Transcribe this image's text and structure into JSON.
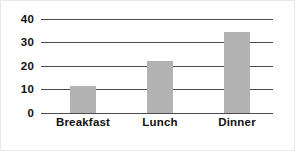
{
  "chart_data": {
    "type": "bar",
    "title": "",
    "xlabel": "",
    "ylabel": "",
    "categories": [
      "Breakfast",
      "Lunch",
      "Dinner"
    ],
    "values": [
      11.5,
      22,
      34.5
    ],
    "ylim": [
      0,
      40
    ],
    "yticks": [
      "0",
      "10",
      "20",
      "30",
      "40"
    ],
    "ytick_values": [
      0,
      10,
      20,
      30,
      40
    ],
    "grid": true,
    "legend": false,
    "bar_color": "#b3b3b3",
    "gridline_color": "#4d4d4d",
    "text_color": "#111111",
    "background_color": "#ffffff"
  }
}
